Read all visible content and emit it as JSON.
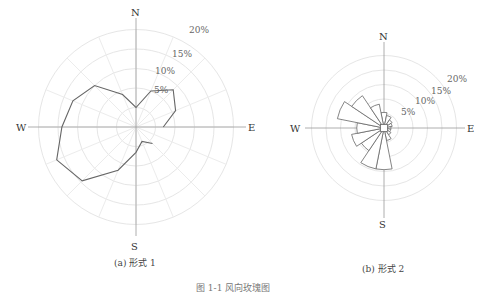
{
  "figures": [
    {
      "id": "a",
      "caption": "(a) 形式 1"
    },
    {
      "id": "b",
      "caption": "(b) 形式 2"
    }
  ],
  "figure_caption": "图 1-1  风向玫瑰图",
  "directions": {
    "N": "N",
    "E": "E",
    "S": "S",
    "W": "W"
  },
  "ring_labels": [
    "5%",
    "10%",
    "15%",
    "20%"
  ],
  "colors": {
    "outline": "#666666",
    "grid": "#e6e6e6",
    "axis": "#9a9a9a"
  },
  "chart_data": [
    {
      "type": "radar",
      "title": "(a) 形式 1",
      "directions": [
        "N",
        "NNE",
        "NE",
        "ENE",
        "E",
        "ESE",
        "SE",
        "SSE",
        "S",
        "SSW",
        "SW",
        "WSW",
        "W",
        "WNW",
        "NW",
        "NNW"
      ],
      "values_percent": [
        5,
        10,
        13.5,
        11,
        7,
        0,
        6,
        4,
        6.5,
        12,
        19.5,
        22,
        19,
        17.5,
        15,
        9
      ],
      "ring_labels": [
        "5%",
        "10%",
        "15%",
        "20%"
      ],
      "rlim": [
        0,
        25
      ],
      "grid": true
    },
    {
      "type": "polar-bar",
      "title": "(b) 形式 2",
      "directions": [
        "N",
        "NNE",
        "NE",
        "ENE",
        "E",
        "ESE",
        "SE",
        "SSE",
        "S",
        "SSW",
        "SW",
        "WSW",
        "W",
        "WNW",
        "NW",
        "NNW"
      ],
      "values_percent": [
        4,
        3,
        2,
        1.5,
        1,
        1,
        1.5,
        3,
        13,
        13,
        8,
        10,
        8,
        15,
        12,
        7
      ],
      "ring_labels": [
        "5%",
        "10%",
        "15%",
        "20%"
      ],
      "rlim": [
        0,
        25
      ],
      "grid": true
    }
  ]
}
